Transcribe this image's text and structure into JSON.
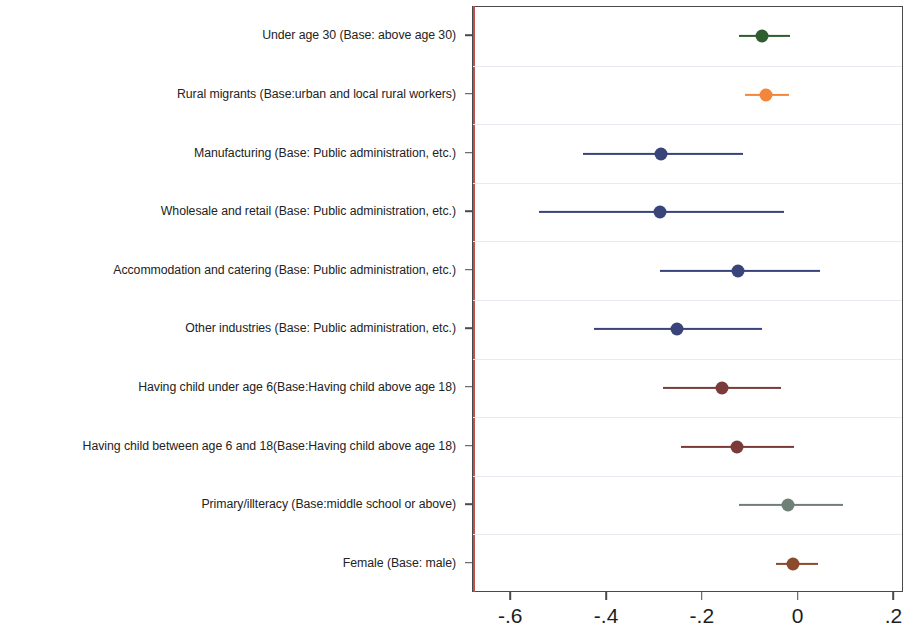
{
  "chart_data": {
    "type": "scatter",
    "plot_kind": "coefficient-forest-plot",
    "title": "",
    "xlabel": "",
    "ylabel": "",
    "xlim": [
      -0.68,
      0.22
    ],
    "grid": true,
    "legend": "none",
    "zero_reference_line": 0,
    "zero_line_color": "#c0504d",
    "xticks": [
      -0.6,
      -0.4,
      -0.2,
      0,
      0.2
    ],
    "xticklabels": [
      "-.6",
      "-.4",
      "-.2",
      "0",
      ".2"
    ],
    "categories": [
      "Under age 30 (Base: above age 30)",
      "Rural migrants (Base:urban and local rural workers)",
      "Manufacturing (Base: Public administration, etc.)",
      "Wholesale and retail (Base: Public administration, etc.)",
      "Accommodation and catering (Base: Public administration, etc.)",
      "Other industries (Base: Public administration, etc.)",
      "Having child under age 6(Base:Having child above age 18)",
      "Having child between age 6 and 18(Base:Having child above age 18)",
      "Primary/illteracy (Base:middle school or above)",
      "Female (Base: male)"
    ],
    "points": [
      {
        "label": "Under age 30 (Base: above age 30)",
        "estimate": -0.077,
        "ci_low": -0.125,
        "ci_high": -0.018,
        "color": "#2f5d30"
      },
      {
        "label": "Rural migrants (Base:urban and local rural workers)",
        "estimate": -0.069,
        "ci_low": -0.113,
        "ci_high": -0.02,
        "color": "#f2873c"
      },
      {
        "label": "Manufacturing (Base: Public administration, etc.)",
        "estimate": -0.287,
        "ci_low": -0.451,
        "ci_high": -0.117,
        "color": "#39447a"
      },
      {
        "label": "Wholesale and retail (Base: Public administration, etc.)",
        "estimate": -0.289,
        "ci_low": -0.542,
        "ci_high": -0.03,
        "color": "#39447a"
      },
      {
        "label": "Accommodation and catering (Base: Public administration, etc.)",
        "estimate": -0.126,
        "ci_low": -0.29,
        "ci_high": 0.045,
        "color": "#39447a"
      },
      {
        "label": "Other industries (Base: Public administration, etc.)",
        "estimate": -0.255,
        "ci_low": -0.427,
        "ci_high": -0.077,
        "color": "#39447a"
      },
      {
        "label": "Having child under age 6(Base:Having child above age 18)",
        "estimate": -0.16,
        "ci_low": -0.283,
        "ci_high": -0.036,
        "color": "#7b3b3b"
      },
      {
        "label": "Having child between age 6 and 18(Base:Having child above age 18)",
        "estimate": -0.128,
        "ci_low": -0.245,
        "ci_high": -0.01,
        "color": "#7b3b3b"
      },
      {
        "label": "Primary/illteracy (Base:middle school or above)",
        "estimate": -0.022,
        "ci_low": -0.124,
        "ci_high": 0.093,
        "color": "#6f8077"
      },
      {
        "label": "Female (Base: male)",
        "estimate": -0.012,
        "ci_low": -0.047,
        "ci_high": 0.04,
        "color": "#8b4a2b"
      }
    ]
  },
  "axis": {
    "tick_color": "#4a4a4a",
    "frame_color": "#4a4a4a",
    "gridline_color": "#e9e9ef"
  }
}
